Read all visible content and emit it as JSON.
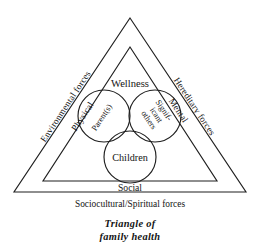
{
  "figure": {
    "title_lines": [
      "Triangle of",
      "family health"
    ],
    "outer_triangle": {
      "label_left": "Environmental forces",
      "label_right": "Hereditary forces",
      "label_bottom": "Sociocultural/Spiritual forces"
    },
    "inner_triangle": {
      "label_left": "Physical",
      "label_right": "Mental",
      "label_bottom": "Social",
      "label_top": "Wellness"
    },
    "circles": [
      {
        "id": "parents",
        "label": "Parent(s)",
        "cx": 104,
        "cy": 116,
        "r": 26
      },
      {
        "id": "significant-others",
        "label_lines": [
          "Signif-",
          "icant",
          "others"
        ],
        "cx": 155,
        "cy": 116,
        "r": 26
      },
      {
        "id": "children",
        "label": "Children",
        "cx": 130,
        "cy": 157,
        "r": 26
      }
    ],
    "colors": {
      "stroke": "#1f1f1f",
      "text": "#141414",
      "background": "#ffffff"
    }
  }
}
